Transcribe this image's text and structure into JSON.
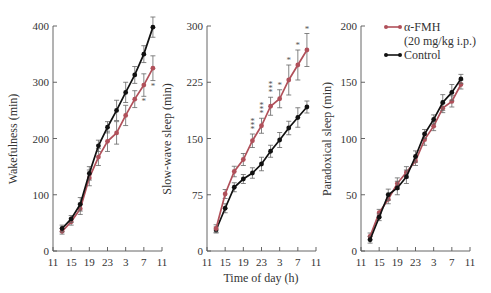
{
  "chart_data": [
    {
      "type": "line",
      "title": "",
      "xlabel": "",
      "ylabel": "Wakefulness (min)",
      "ylim": [
        0,
        400
      ],
      "yticks": [
        0,
        100,
        200,
        300,
        400
      ],
      "xticks": [
        "11",
        "15",
        "19",
        "23",
        "3",
        "7",
        "11"
      ],
      "x": [
        "13",
        "15",
        "17",
        "19",
        "21",
        "23",
        "1",
        "3",
        "5",
        "7",
        "9"
      ],
      "series": [
        {
          "name": "Control",
          "color": "#111111",
          "values": [
            40,
            57,
            83,
            138,
            187,
            220,
            250,
            282,
            313,
            350,
            398
          ],
          "errors": [
            6,
            6,
            12,
            12,
            10,
            10,
            18,
            18,
            15,
            15,
            18
          ]
        },
        {
          "name": "α-FMH (20 mg/kg i.p.)",
          "color": "#b0505a",
          "values": [
            35,
            52,
            75,
            130,
            167,
            195,
            210,
            241,
            270,
            295,
            325
          ],
          "errors": [
            5,
            6,
            10,
            14,
            15,
            18,
            20,
            18,
            15,
            20,
            22
          ]
        }
      ],
      "annotations": [
        {
          "x": "7",
          "text": "*"
        },
        {
          "x": "9",
          "text": "*"
        }
      ]
    },
    {
      "type": "line",
      "title": "",
      "xlabel": "Time of day (h)",
      "ylabel": "Slow-wave sleep (min)",
      "ylim": [
        0,
        300
      ],
      "yticks": [
        0,
        75,
        150,
        225,
        300
      ],
      "xticks": [
        "11",
        "15",
        "19",
        "23",
        "3",
        "7",
        "11"
      ],
      "x": [
        "13",
        "15",
        "17",
        "19",
        "21",
        "23",
        "1",
        "3",
        "5",
        "7",
        "9"
      ],
      "series": [
        {
          "name": "Control",
          "color": "#111111",
          "values": [
            28,
            57,
            85,
            96,
            104,
            116,
            133,
            148,
            164,
            178,
            192
          ],
          "errors": [
            4,
            6,
            6,
            6,
            7,
            9,
            8,
            10,
            9,
            13,
            8
          ]
        },
        {
          "name": "α-FMH (20 mg/kg i.p.)",
          "color": "#b0505a",
          "values": [
            30,
            76,
            106,
            122,
            147,
            167,
            193,
            203,
            228,
            248,
            268
          ],
          "errors": [
            5,
            6,
            7,
            8,
            9,
            10,
            12,
            12,
            20,
            20,
            22
          ]
        }
      ],
      "annotations": [
        {
          "x": "21",
          "text": "***"
        },
        {
          "x": "23",
          "text": "***"
        },
        {
          "x": "1",
          "text": "***"
        },
        {
          "x": "3",
          "text": "*"
        },
        {
          "x": "5",
          "text": "*"
        },
        {
          "x": "7",
          "text": "*"
        },
        {
          "x": "9",
          "text": "*"
        }
      ]
    },
    {
      "type": "line",
      "title": "",
      "xlabel": "",
      "ylabel": "Paradoxical sleep (min)",
      "ylim": [
        0,
        200
      ],
      "yticks": [
        0,
        50,
        100,
        150,
        200
      ],
      "xticks": [
        "11",
        "15",
        "19",
        "23",
        "3",
        "7",
        "11"
      ],
      "x": [
        "13",
        "15",
        "17",
        "19",
        "21",
        "23",
        "1",
        "3",
        "5",
        "7",
        "9"
      ],
      "series": [
        {
          "name": "Control",
          "color": "#111111",
          "values": [
            10,
            30,
            50,
            56,
            66,
            84,
            104,
            117,
            132,
            141,
            153
          ],
          "errors": [
            3,
            3,
            5,
            6,
            6,
            5,
            4,
            4,
            7,
            7,
            4
          ]
        },
        {
          "name": "α-FMH (20 mg/kg i.p.)",
          "color": "#b0505a",
          "values": [
            13,
            34,
            46,
            60,
            70,
            80,
            99,
            111,
            127,
            133,
            148
          ],
          "errors": [
            3,
            3,
            4,
            5,
            5,
            4,
            5,
            4,
            4,
            5,
            4
          ]
        }
      ],
      "legend": {
        "position": "top-left",
        "entries": [
          "α-FMH",
          "(20 mg/kg i.p.)",
          "Control"
        ]
      }
    }
  ],
  "legend": {
    "line1": "α-FMH",
    "line2": "(20 mg/kg i.p.)",
    "line3": "Control"
  },
  "labels": {
    "ylabel1": "Wakefulness (min)",
    "ylabel2": "Slow-wave sleep (min)",
    "ylabel3": "Paradoxical sleep (min)",
    "xlabel2": "Time of day (h)"
  }
}
